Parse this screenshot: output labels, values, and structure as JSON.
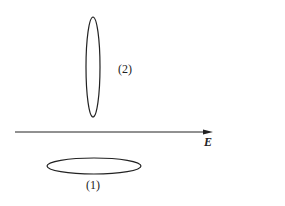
{
  "diagram": {
    "labels": {
      "ellipse_2": "(2)",
      "ellipse_1": "(1)",
      "field_axis": "E"
    },
    "elements": [
      {
        "id": "ellipse-2",
        "shape": "ellipse",
        "orientation": "vertical",
        "cx": 93,
        "cy": 67,
        "rx": 7,
        "ry": 50,
        "label": "(2)"
      },
      {
        "id": "ellipse-1",
        "shape": "ellipse",
        "orientation": "horizontal",
        "cx": 94,
        "cy": 166,
        "rx": 47,
        "ry": 8,
        "label": "(1)"
      },
      {
        "id": "e-field-arrow",
        "shape": "arrow",
        "x1": 15,
        "y1": 132,
        "x2": 213,
        "y2": 132,
        "label": "E"
      }
    ],
    "colors": {
      "stroke": "#222222",
      "background": "#ffffff"
    }
  }
}
